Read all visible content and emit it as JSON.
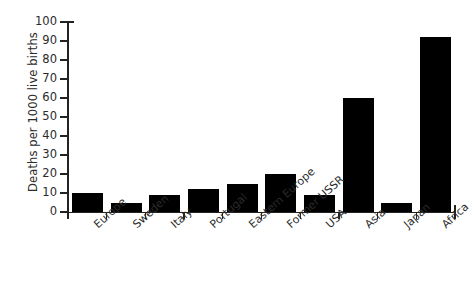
{
  "chart_data": {
    "type": "bar",
    "title": "",
    "xlabel": "",
    "ylabel": "Deaths per 1000 live births",
    "ylim": [
      0,
      100
    ],
    "yticks": [
      0,
      10,
      20,
      30,
      40,
      50,
      60,
      70,
      80,
      90,
      100
    ],
    "ytick_labels": [
      "0",
      "10",
      "20",
      "30",
      "40",
      "50",
      "60",
      "70",
      "80",
      "90",
      "100"
    ],
    "grid": false,
    "legend": null,
    "bar_color": "#000000",
    "categories": [
      "Europe",
      "Sweden",
      "Italy",
      "Portugal",
      "Eastern Europe",
      "Former USSR",
      "USA",
      "Asia",
      "Japan",
      "Africa"
    ],
    "values": [
      10,
      5,
      9,
      12,
      15,
      20,
      9,
      60,
      5,
      92
    ]
  }
}
